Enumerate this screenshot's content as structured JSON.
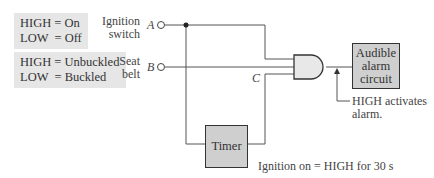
{
  "legend_ignition": {
    "line1": "HIGH = On",
    "line2": "LOW  = Off"
  },
  "legend_seatbelt": {
    "line1": "HIGH = Unbuckled",
    "line2": "LOW  = Buckled"
  },
  "inputs": {
    "ignition": {
      "label1": "Ignition",
      "label2": "switch",
      "signal": "A"
    },
    "seatbelt": {
      "label1": "Seat",
      "label2": "belt",
      "signal": "B"
    },
    "timer_signal": "C"
  },
  "blocks": {
    "alarm": {
      "line1": "Audible",
      "line2": "alarm",
      "line3": "circuit"
    },
    "timer": {
      "label": "Timer"
    }
  },
  "annotations": {
    "output_note1": "HIGH activates",
    "output_note2": "alarm.",
    "timer_note": "Ignition on = HIGH for 30 s"
  }
}
